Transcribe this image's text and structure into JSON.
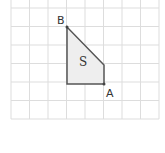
{
  "diagram": {
    "grid": {
      "x0": 11,
      "y0": 8,
      "cell": 18.5,
      "cols": 8,
      "rows": 6,
      "line_color": "#dddddd"
    },
    "shape": {
      "label": "S",
      "fill": "#eeeeee",
      "stroke": "#555555",
      "points": "67,27 67,84 104,84 104,65"
    },
    "points": [
      {
        "name": "B",
        "x": 67,
        "y": 27,
        "label_x": 57,
        "label_y": 24
      },
      {
        "name": "A",
        "x": 104,
        "y": 84,
        "label_x": 106,
        "label_y": 97
      }
    ]
  }
}
